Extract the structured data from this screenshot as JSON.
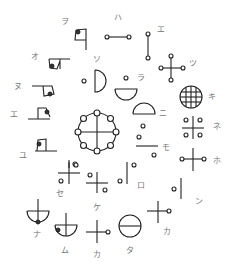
{
  "labels": {
    "wo": "ヲ",
    "ha": "ハ",
    "e": "エ",
    "o": "オ",
    "so": "ソ",
    "tsu": "ツ",
    "nu": "ヌ",
    "ra": "ラ",
    "ki": "キ",
    "e2": "エ",
    "ni": "ニ",
    "ne": "ネ",
    "mo": "モ",
    "yu": "ユ",
    "ho": "ホ",
    "se": "セ",
    "ro": "ロ",
    "ke": "ケ",
    "n": "ン",
    "na": "ナ",
    "mu": "ム",
    "ka1": "カ",
    "ta": "タ",
    "ka2": "カ"
  }
}
